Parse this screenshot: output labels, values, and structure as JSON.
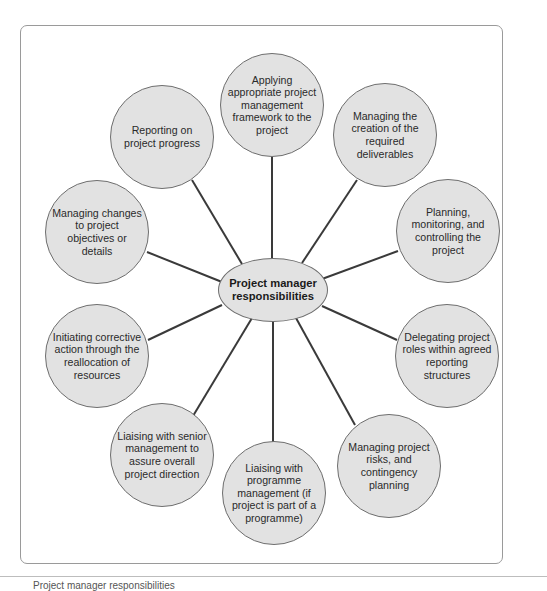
{
  "diagram": {
    "center": {
      "label": "Project manager responsibilities"
    },
    "nodes": [
      {
        "id": "applying-framework",
        "label": "Applying appropriate project management framework to the project"
      },
      {
        "id": "managing-deliverables",
        "label": "Managing the creation of the required deliverables"
      },
      {
        "id": "planning-monitoring",
        "label": "Planning, monitoring, and controlling the project"
      },
      {
        "id": "delegating-roles",
        "label": "Delegating project roles within agreed reporting structures"
      },
      {
        "id": "managing-risks",
        "label": "Managing project risks, and contingency planning"
      },
      {
        "id": "liaising-programme",
        "label": "Liaising with programme management (if project is part of a programme)"
      },
      {
        "id": "liaising-senior",
        "label": "Liaising with senior management to assure overall project direction"
      },
      {
        "id": "initiating-corrective",
        "label": "Initiating corrective action through the reallocation of resources"
      },
      {
        "id": "managing-changes",
        "label": "Managing changes to project objectives or details"
      },
      {
        "id": "reporting-progress",
        "label": "Reporting on project progress"
      }
    ],
    "colors": {
      "node_fill": "#e2e2e2",
      "node_border": "#6e6e6e",
      "connector": "#3a3a3a",
      "frame_border": "#9a9a9a"
    }
  },
  "caption": {
    "text": "Project manager responsibilities"
  }
}
